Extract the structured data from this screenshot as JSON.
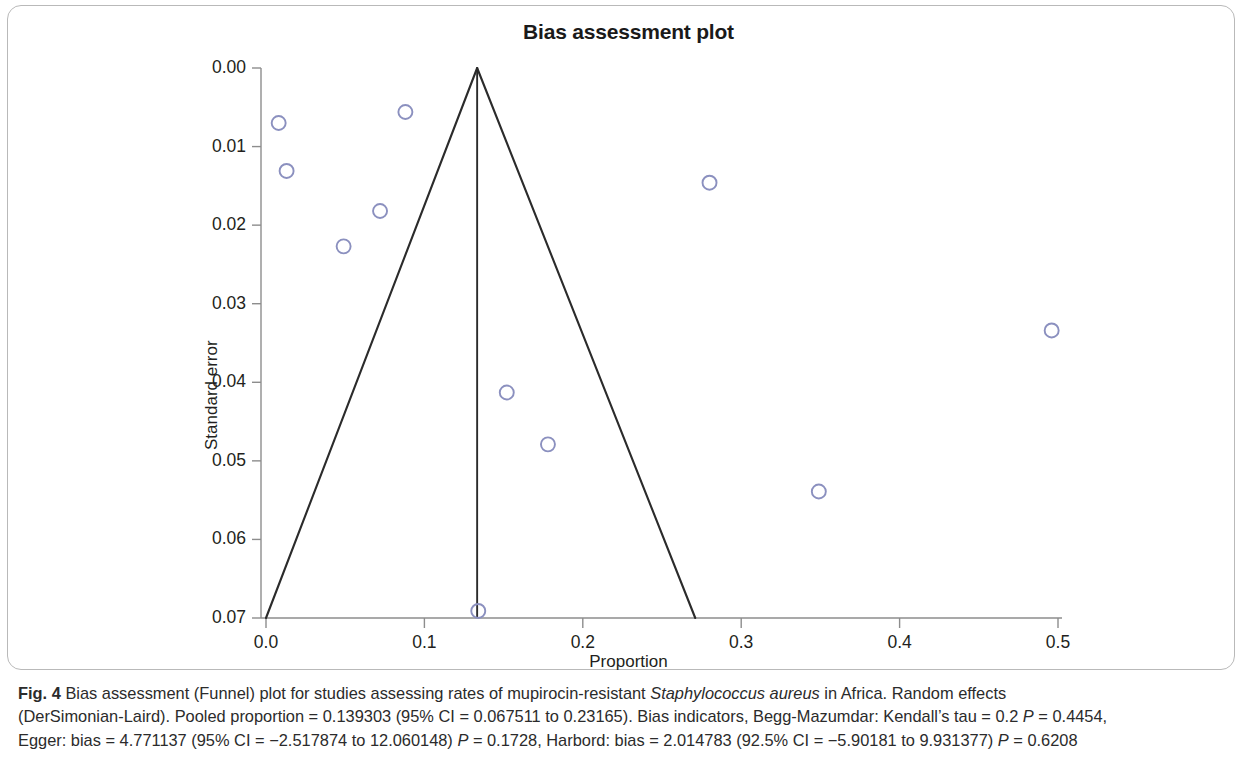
{
  "figure": {
    "label": "Fig. 4",
    "caption_lines": [
      "Bias assessment (Funnel) plot for studies assessing rates of mupirocin-resistant ",
      "(DerSimonian-Laird). Pooled proportion = 0.139303 (95% CI = 0.067511 to 0.23165). Bias indicators, Begg-Mazumdar: Kendall’s tau = 0.2 ",
      "Egger: bias = 4.771137 (95% CI = −2.517874 to 12.060148) "
    ],
    "caption_italic_species": "Staphylococcus aureus",
    "caption_line1_tail": " in Africa. Random effects",
    "caption_line2_p_italic": "P",
    "caption_line2_tail": " = 0.4454,",
    "caption_line3_p_italic": "P",
    "caption_line3_mid": " = 0.1728, Harbord: bias = 2.014783 (92.5% CI = −5.90181 to 9.931377) ",
    "caption_line3_p2_italic": "P",
    "caption_line3_tail": " = 0.6208"
  },
  "chart_data": {
    "type": "scatter",
    "title": "Bias assessment plot",
    "xlabel": "Proportion",
    "ylabel": "Standard error",
    "xlim": [
      0.0,
      0.5
    ],
    "ylim": [
      0.07,
      0.0
    ],
    "y_inverted": true,
    "grid": false,
    "legend": null,
    "xticks": [
      "0.0",
      "0.1",
      "0.2",
      "0.3",
      "0.4",
      "0.5"
    ],
    "xtick_values": [
      0.0,
      0.1,
      0.2,
      0.3,
      0.4,
      0.5
    ],
    "yticks": [
      "0.00",
      "0.01",
      "0.02",
      "0.03",
      "0.04",
      "0.05",
      "0.06",
      "0.07"
    ],
    "ytick_values": [
      0.0,
      0.01,
      0.02,
      0.03,
      0.04,
      0.05,
      0.06,
      0.07
    ],
    "marker": "open-circle",
    "marker_color": "#8b90bf",
    "line_color": "#2b2b2b",
    "points": [
      {
        "x": 0.008,
        "y": 0.007
      },
      {
        "x": 0.013,
        "y": 0.0131
      },
      {
        "x": 0.088,
        "y": 0.0056
      },
      {
        "x": 0.072,
        "y": 0.0182
      },
      {
        "x": 0.049,
        "y": 0.0227
      },
      {
        "x": 0.28,
        "y": 0.0146
      },
      {
        "x": 0.496,
        "y": 0.0334
      },
      {
        "x": 0.152,
        "y": 0.0413
      },
      {
        "x": 0.178,
        "y": 0.0479
      },
      {
        "x": 0.349,
        "y": 0.0539
      },
      {
        "x": 0.134,
        "y": 0.0691
      }
    ],
    "pooled_proportion": 0.1333,
    "funnel_apex": {
      "x": 0.1333,
      "y": 0.0
    },
    "funnel_left_base": {
      "x": 0.0,
      "y": 0.07
    },
    "funnel_right_base": {
      "x": 0.271,
      "y": 0.07
    },
    "reference_line": {
      "x": 0.1333,
      "y_top": 0.0,
      "y_bottom": 0.07
    }
  }
}
